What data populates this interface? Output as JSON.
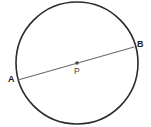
{
  "figure": {
    "background_color": "#ffffff",
    "width": 151,
    "height": 127
  },
  "circle": {
    "name": "circle-outline",
    "center_x": 77,
    "center_y": 63,
    "radius": 61,
    "stroke_color": "#2b2b2b",
    "stroke_width": 1.6,
    "fill": "none"
  },
  "diameter": {
    "name": "diameter-segment-AB",
    "x1": 18,
    "y1": 80,
    "x2": 134,
    "y2": 47,
    "stroke_color": "#6b6b6b",
    "stroke_width": 1.1
  },
  "center_point": {
    "name": "center-point-P",
    "x": 77,
    "y": 63,
    "radius": 1.8,
    "color": "#4a4a4a"
  },
  "labels": {
    "a": {
      "text": "A",
      "x": 8,
      "y": 82
    },
    "b": {
      "text": "B",
      "x": 137,
      "y": 47
    },
    "p": {
      "text": "P",
      "x": 74,
      "y": 74
    }
  }
}
